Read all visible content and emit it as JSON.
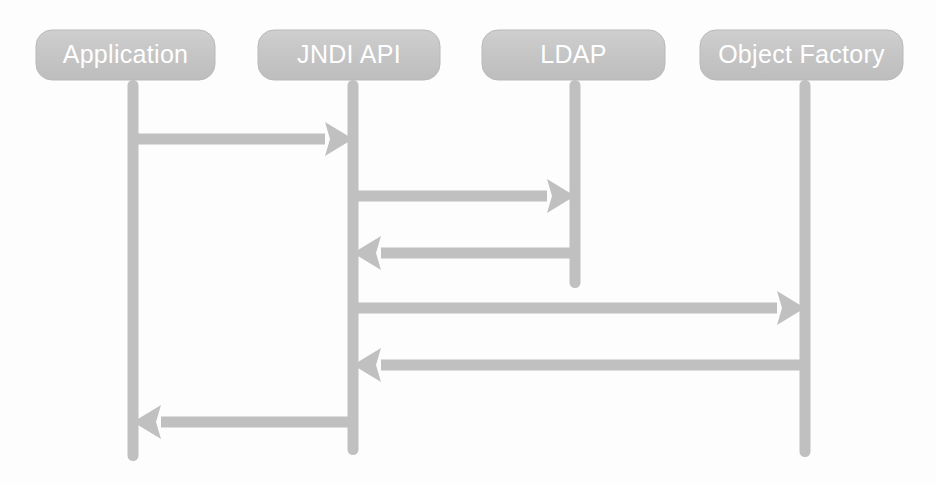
{
  "diagram": {
    "type": "uml-sequence-diagram",
    "background_color": "#fdfdfd",
    "shape_fill_color": "#c4c4c4",
    "shape_edge_color": "#b9b9b9",
    "label_text_color": "#ffffff",
    "arrow_color": "#c0c0c0",
    "participants": [
      {
        "id": "application",
        "label": "Application",
        "box": {
          "x": 36,
          "y": 30,
          "width": 179,
          "height": 50,
          "radius": 16
        },
        "lifeline": {
          "x": 133,
          "top": 80,
          "bottom": 461,
          "width": 11
        }
      },
      {
        "id": "jndi-api",
        "label": "JNDI API",
        "box": {
          "x": 258,
          "y": 30,
          "width": 182,
          "height": 50,
          "radius": 16
        },
        "lifeline": {
          "x": 353,
          "top": 80,
          "bottom": 455,
          "width": 11
        }
      },
      {
        "id": "ldap",
        "label": "LDAP",
        "box": {
          "x": 482,
          "y": 30,
          "width": 183,
          "height": 50,
          "radius": 16
        },
        "lifeline": {
          "x": 575,
          "top": 80,
          "bottom": 288,
          "width": 11
        }
      },
      {
        "id": "object-factory",
        "label": "Object Factory",
        "box": {
          "x": 700,
          "y": 30,
          "width": 203,
          "height": 50,
          "radius": 16
        },
        "lifeline": {
          "x": 805,
          "top": 80,
          "bottom": 457,
          "width": 11
        }
      }
    ],
    "messages": [
      {
        "id": "message-1",
        "name": "application-to-jndi-request",
        "from": "application",
        "to": "jndi-api",
        "direction": "right",
        "from_x": 133,
        "to_x": 353,
        "y": 139,
        "thickness": 11
      },
      {
        "id": "message-2",
        "name": "jndi-to-ldap-request",
        "from": "jndi-api",
        "to": "ldap",
        "direction": "right",
        "from_x": 353,
        "to_x": 575,
        "y": 196,
        "thickness": 11
      },
      {
        "id": "message-3",
        "name": "ldap-to-jndi-response",
        "from": "ldap",
        "to": "jndi-api",
        "direction": "left",
        "from_x": 575,
        "to_x": 353,
        "y": 253,
        "thickness": 11
      },
      {
        "id": "message-4",
        "name": "jndi-to-object-factory-request",
        "from": "jndi-api",
        "to": "object-factory",
        "direction": "right",
        "from_x": 353,
        "to_x": 805,
        "y": 308,
        "thickness": 11
      },
      {
        "id": "message-5",
        "name": "object-factory-to-jndi-response",
        "from": "object-factory",
        "to": "jndi-api",
        "direction": "left",
        "from_x": 805,
        "to_x": 353,
        "y": 365,
        "thickness": 11
      },
      {
        "id": "message-6",
        "name": "jndi-to-application-response",
        "from": "jndi-api",
        "to": "application",
        "direction": "left",
        "from_x": 353,
        "to_x": 133,
        "y": 422,
        "thickness": 11
      }
    ]
  }
}
